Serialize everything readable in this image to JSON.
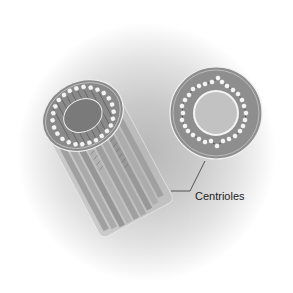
{
  "figure": {
    "subject": "Centrioles",
    "label": "Centrioles",
    "views": [
      {
        "name": "longitudinal-cylinder",
        "description": "Centriole shown as cylinder with microtubule triplets"
      },
      {
        "name": "cross-section",
        "description": "Cross-section showing ring of microtubule triplets"
      }
    ],
    "colors": {
      "background_glow": "#c4c4c4",
      "cylinder_body": "#a8a8a8",
      "ring_fill": "#8e8e8e",
      "tubule_dots": "#f2f2f2",
      "outline": "#ececec",
      "label_text": "#222222"
    }
  }
}
